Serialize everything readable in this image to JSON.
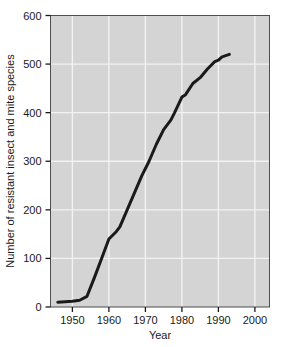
{
  "chart_data": {
    "type": "line",
    "title": "",
    "xlabel": "Year",
    "ylabel": "Number of resistant insect and mite species",
    "xlim": [
      1944,
      2004
    ],
    "ylim": [
      0,
      600
    ],
    "xticks": [
      1950,
      1960,
      1970,
      1980,
      1990,
      2000
    ],
    "xtick_labels": [
      "1950",
      "1960",
      "1970",
      "1980",
      "1990",
      "2000"
    ],
    "yticks": [
      0,
      100,
      200,
      300,
      400,
      500,
      600
    ],
    "ytick_labels": [
      "0",
      "100",
      "200",
      "300",
      "400",
      "500",
      "600"
    ],
    "grid": true,
    "grid_color": "#f2f2f2",
    "plot_background": "#d4d4d4",
    "line_color": "#1a1a1a",
    "line_width": 3,
    "legend": null,
    "series": [
      {
        "name": "Resistant insect and mite species",
        "x": [
          1946,
          1950,
          1952,
          1954,
          1956,
          1958,
          1960,
          1962,
          1963,
          1965,
          1967,
          1969,
          1971,
          1973,
          1975,
          1977,
          1978,
          1980,
          1981,
          1983,
          1985,
          1987,
          1989,
          1990,
          1991,
          1993
        ],
        "values": [
          10,
          12,
          14,
          22,
          60,
          100,
          140,
          155,
          165,
          200,
          235,
          270,
          300,
          335,
          365,
          385,
          400,
          432,
          437,
          460,
          472,
          490,
          505,
          508,
          515,
          520
        ]
      }
    ]
  },
  "axes": {
    "x_axis_label": "Year",
    "y_axis_label": "Number of resistant insect and mite species"
  }
}
